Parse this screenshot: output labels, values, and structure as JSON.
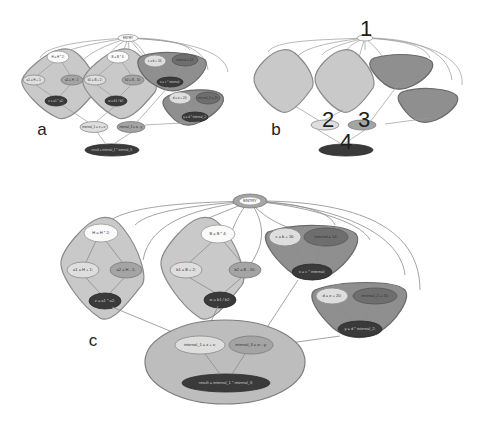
{
  "panels": {
    "a": {
      "label": "a",
      "entry": "ENTRY",
      "clusters": [
        {
          "nodes": [
            "H = H * 2;",
            "a1 = H + 1;",
            "a2 = H - 1;",
            "z = a1 * a2;"
          ]
        },
        {
          "nodes": [
            "B = B * 4;",
            "b1 = B + 2;",
            "b2 = B - 10;",
            "w = b1 / b2;"
          ]
        },
        {
          "nodes": [
            "c = b + 16;",
            "internal = 14;",
            "x = c * internal;"
          ]
        },
        {
          "nodes": [
            "d = e + 20;",
            "internal_2 = 15;",
            "y = d * internal_2;"
          ]
        }
      ],
      "bottom": {
        "nodes": [
          "internal_1 = z + x;",
          "internal_3 = w - y;",
          "result = internal_1 * internal_3;"
        ]
      }
    },
    "b": {
      "label": "b",
      "numbers": [
        "1",
        "2",
        "3",
        "4"
      ]
    },
    "c": {
      "label": "c",
      "entry": "ENTRY",
      "clusters": [
        {
          "nodes": [
            "H = H * 2;",
            "a1 = H + 1;",
            "a2 = H - 1;",
            "z = a1 * a2;"
          ]
        },
        {
          "nodes": [
            "B = B * 4;",
            "b1 = B + 2;",
            "b2 = B - 10;",
            "w = b1 / b2;"
          ]
        },
        {
          "nodes": [
            "c = b + 16;",
            "internal = 14;",
            "x = c * internal;"
          ]
        },
        {
          "nodes": [
            "d = e + 20;",
            "internal_2 = 15;",
            "y = d * internal_2;"
          ]
        }
      ],
      "bottom": {
        "nodes": [
          "internal_1 = z + x;",
          "internal_3 = w - y;",
          "result = internal_1 * internal_3;"
        ]
      }
    }
  }
}
